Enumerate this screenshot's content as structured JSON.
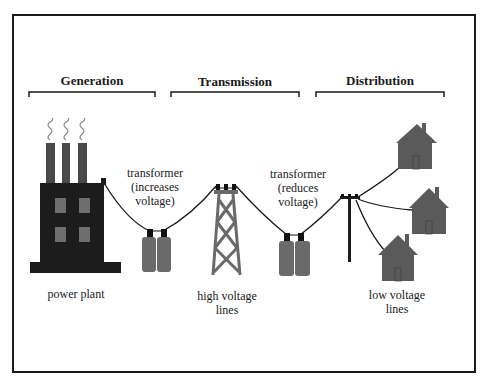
{
  "diagram": {
    "sections": [
      {
        "id": "generation",
        "label": "Generation"
      },
      {
        "id": "transmission",
        "label": "Transmission"
      },
      {
        "id": "distribution",
        "label": "Distribution"
      }
    ],
    "labels": {
      "power_plant": "power plant",
      "transformer_up": {
        "line1": "transformer",
        "line2": "(increases",
        "line3": "voltage)"
      },
      "high_voltage": {
        "line1": "high voltage",
        "line2": "lines"
      },
      "transformer_down": {
        "line1": "transformer",
        "line2": "(reduces",
        "line3": "voltage)"
      },
      "low_voltage": {
        "line1": "low voltage",
        "line2": "lines"
      }
    },
    "colors": {
      "factory": "#1c1c1c",
      "stack": "#4a4a4a",
      "window": "#6e6e6e",
      "transformer": "#6a6a6a",
      "house": "#5a5a5a",
      "tower": "#6a6a6a",
      "line": "#1a1a1a"
    }
  }
}
